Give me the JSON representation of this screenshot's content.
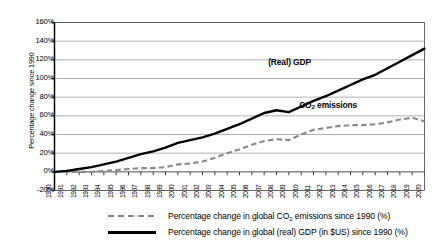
{
  "chart_data": {
    "type": "line",
    "title": "",
    "xlabel": "",
    "ylabel": "Percentage change since 1990",
    "ylim": [
      -20,
      160
    ],
    "ytick_labels": [
      "160%",
      "140%",
      "120%",
      "100%",
      "80%",
      "60%",
      "40%",
      "20%",
      "0%",
      "-20%"
    ],
    "ytick_values": [
      160,
      140,
      120,
      100,
      80,
      60,
      40,
      20,
      0,
      -20
    ],
    "grid": true,
    "legend_position": "bottom",
    "x": [
      1990,
      1991,
      1992,
      1993,
      1994,
      1995,
      1996,
      1997,
      1998,
      1999,
      2000,
      2001,
      2002,
      2003,
      2004,
      2005,
      2006,
      2007,
      2008,
      2009,
      2010,
      2011,
      2012,
      2013,
      2014,
      2015,
      2016,
      2017,
      2018,
      2019,
      2020
    ],
    "categories": [
      "1990",
      "1991",
      "1992",
      "1993",
      "1994",
      "1995",
      "1996",
      "1997",
      "1998",
      "1999",
      "2000",
      "2001",
      "2002",
      "2003",
      "2004",
      "2005",
      "2006",
      "2007",
      "2008",
      "2009",
      "2010",
      "2011",
      "2012",
      "2013",
      "2014",
      "2015",
      "2016",
      "2017",
      "2018",
      "2019",
      "2020"
    ],
    "series": [
      {
        "name": "Percentage change in global CO2 emissions since 1990 (%)",
        "short_name": "CO2 emissions",
        "style": "dashed",
        "color": "#8a8a8a",
        "values": [
          0,
          0,
          0,
          0,
          1,
          2,
          3,
          4,
          4,
          5,
          8,
          9,
          11,
          15,
          20,
          24,
          29,
          33,
          35,
          34,
          40,
          45,
          47,
          49,
          50,
          50,
          51,
          53,
          56,
          58,
          54
        ]
      },
      {
        "name": "Percentage change in global (real) GDP (in $US) since 1990 (%)",
        "short_name": "(Real) GDP",
        "style": "solid",
        "color": "#000000",
        "values": [
          0,
          1,
          3,
          5,
          8,
          11,
          15,
          19,
          22,
          26,
          31,
          34,
          37,
          41,
          46,
          51,
          57,
          63,
          66,
          64,
          70,
          76,
          81,
          87,
          93,
          99,
          104,
          111,
          118,
          125,
          132
        ]
      }
    ],
    "annotations": [
      {
        "text": "(Real) GDP",
        "series": "gdp"
      },
      {
        "text": "CO2 emissions",
        "series": "co2"
      }
    ]
  },
  "legend": {
    "items": [
      {
        "style": "dashed",
        "prefix": "Percentage change in global CO",
        "sub": "2",
        "suffix": " emissions since 1990 (%)"
      },
      {
        "style": "solid",
        "prefix": "Percentage change in global (real) GDP (in $US) since 1990 (%)",
        "sub": "",
        "suffix": ""
      }
    ]
  },
  "labels": {
    "gdp_prefix": "(Real) GDP",
    "co2_prefix": "CO",
    "co2_sub": "2",
    "co2_suffix": " emissions"
  }
}
